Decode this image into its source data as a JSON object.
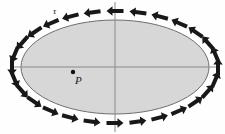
{
  "figure": {
    "background_color": "#fefefe",
    "labels": {
      "tau": "τ",
      "point_p": "P"
    },
    "ellipse": {
      "center_x": 115,
      "center_y": 67,
      "radius_x": 94,
      "radius_y": 47,
      "fill_color": "#d7d7d7",
      "stroke_color": "#6e6e6e",
      "stroke_width": 1
    },
    "axes": {
      "color": "#8a8a8a",
      "stroke_width": 1,
      "horizontal": {
        "x1": 13,
        "y1": 67,
        "x2": 217,
        "y2": 67
      },
      "vertical": {
        "x1": 115,
        "y1": 2,
        "x2": 115,
        "y2": 132
      }
    },
    "interior_point": {
      "name": "P",
      "x": 73,
      "y": 72,
      "radius": 2.2,
      "color": "#111111"
    },
    "arrows": {
      "color": "#181818",
      "count": 28,
      "direction": "clockwise",
      "orbit_radius_x": 103,
      "orbit_radius_y": 56,
      "shaft_length": 11,
      "shaft_width": 4,
      "head_length": 6,
      "head_width": 9.5
    }
  }
}
